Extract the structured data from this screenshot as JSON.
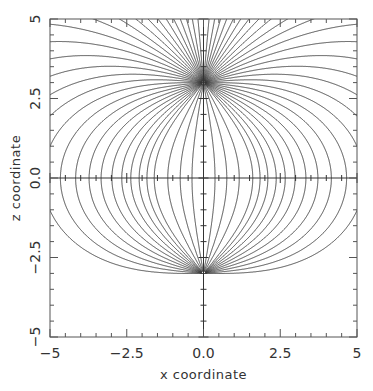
{
  "chart_data": {
    "type": "line",
    "subtype": "field-line contour plot",
    "title": "",
    "xlabel": "x coordinate",
    "ylabel": "z coordinate",
    "xlim": [
      -5,
      5
    ],
    "ylim": [
      -5,
      5
    ],
    "x_ticks": [
      -5,
      -2.5,
      0.0,
      2.5,
      5
    ],
    "x_tick_labels": [
      "−5",
      "−2.5",
      "0.0",
      "2.5",
      "5"
    ],
    "y_ticks": [
      -5,
      -2.5,
      0.0,
      2.5,
      5
    ],
    "y_tick_labels": [
      "−5",
      "−2.5",
      "0.0",
      "2.5",
      "5"
    ],
    "minor_tick_step": 0.5,
    "grid": false,
    "center_axes": true,
    "legend": null,
    "sources": [
      {
        "name": "upper pole",
        "x": 0,
        "z": 3,
        "charge": 1
      },
      {
        "name": "lower pole",
        "x": 0,
        "z": -3,
        "charge": -1
      }
    ],
    "field_line_launch_angles_deg": [
      5,
      10,
      15,
      20,
      25,
      30,
      35,
      40,
      45,
      50,
      55,
      60,
      65,
      70,
      75,
      80,
      85,
      90,
      95,
      100,
      105,
      110,
      115,
      120,
      125,
      130,
      135,
      140,
      150,
      160,
      170
    ],
    "line_color": "#3a3a3a",
    "frame_color": "#555555"
  },
  "plot_area": {
    "left": 50,
    "top": 19,
    "right": 357,
    "bottom": 337
  }
}
